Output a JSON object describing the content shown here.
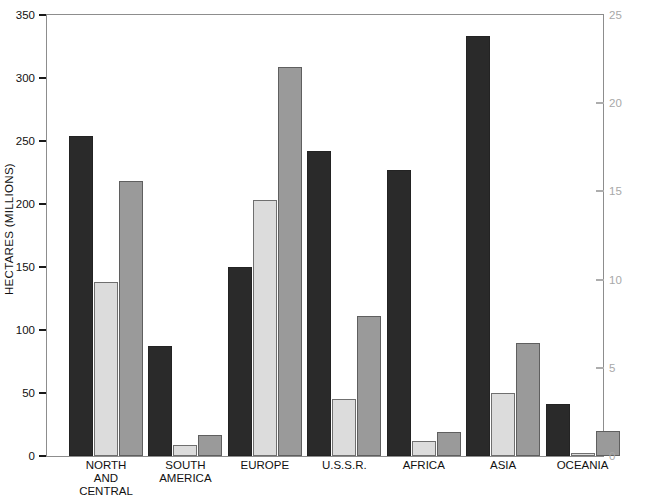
{
  "chart_data": {
    "type": "bar",
    "title": "",
    "xlabel": "",
    "ylabel": "HECTARES (MILLIONS)",
    "ylim": [
      0,
      350
    ],
    "y_ticks": [
      0,
      50,
      100,
      150,
      200,
      250,
      300,
      350
    ],
    "y2lim": [
      0,
      25
    ],
    "y2_ticks": [
      0,
      5,
      10,
      15,
      20,
      25
    ],
    "y2label": "",
    "grid": false,
    "legend": "none",
    "categories": [
      "NORTH\nAND CENTRAL",
      "SOUTH\nAMERICA",
      "EUROPE",
      "U.S.S.R.",
      "AFRICA",
      "ASIA",
      "OCEANIA"
    ],
    "series": [
      {
        "name": "series-1",
        "color": "#2a2a2a",
        "values": [
          254,
          87,
          150,
          242,
          227,
          333,
          41
        ]
      },
      {
        "name": "series-2",
        "color": "#dcdcdc",
        "values": [
          138,
          9,
          203,
          45,
          12,
          50,
          2
        ]
      },
      {
        "name": "series-3",
        "color": "#9a9a9a",
        "values": [
          218,
          17,
          309,
          111,
          19,
          90,
          20
        ]
      }
    ]
  },
  "axes": {
    "left_tick_labels": [
      "0",
      "50",
      "100",
      "150",
      "200",
      "250",
      "300",
      "350"
    ],
    "right_tick_labels": [
      "0",
      "5",
      "10",
      "15",
      "20",
      "25"
    ],
    "left_title": "HECTARES (MILLIONS)"
  },
  "colors": {
    "series_dark": "#2a2a2a",
    "series_light": "#dcdcdc",
    "series_mid": "#9a9a9a",
    "frame": "#8d8d8d",
    "right_axis_text": "#a8a8a8",
    "text": "#111111",
    "background": "#ffffff"
  }
}
